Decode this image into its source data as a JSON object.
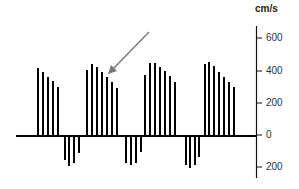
{
  "chart_data": {
    "type": "bar",
    "title": "",
    "xlabel": "",
    "ylabel": "cm/s",
    "ylim": [
      -250,
      650
    ],
    "grid": false,
    "axis_position": "right",
    "yticks": [
      600,
      400,
      200,
      0,
      -200
    ],
    "ytick_labels": [
      "600",
      "400",
      "200",
      "0",
      "200"
    ],
    "series": [
      {
        "name": "forward flow cycle 1",
        "x": [
          38,
          43,
          48,
          53,
          58
        ],
        "values": [
          425,
          400,
          369,
          344,
          306
        ]
      },
      {
        "name": "reverse flow 1",
        "x": [
          65,
          69,
          74,
          79
        ],
        "values": [
          -150,
          -188,
          -169,
          -106
        ]
      },
      {
        "name": "forward flow cycle 2",
        "x": [
          87,
          92,
          97,
          102,
          107,
          112,
          117
        ],
        "values": [
          413,
          450,
          431,
          400,
          369,
          338,
          300
        ]
      },
      {
        "name": "reverse flow 2",
        "x": [
          126,
          131,
          136,
          141
        ],
        "values": [
          -169,
          -181,
          -169,
          -100
        ]
      },
      {
        "name": "forward flow cycle 3",
        "x": [
          145,
          150,
          155,
          160,
          165,
          170,
          175
        ],
        "values": [
          381,
          456,
          456,
          431,
          406,
          375,
          338
        ]
      },
      {
        "name": "reverse flow 3",
        "x": [
          186,
          190,
          195,
          199
        ],
        "values": [
          -181,
          -200,
          -181,
          -131
        ]
      },
      {
        "name": "forward flow cycle 4",
        "x": [
          205,
          209,
          214,
          219,
          224,
          229,
          234
        ],
        "values": [
          450,
          463,
          438,
          400,
          369,
          338,
          306
        ]
      }
    ],
    "annotations": [
      {
        "type": "arrow",
        "from": [
          149,
          32
        ],
        "to": [
          109,
          73
        ],
        "color": "#777777",
        "points_to": "forward flow cycle 2"
      }
    ],
    "colors": {
      "bars": "#000000",
      "axis": "#111111",
      "arrow": "#777777"
    }
  },
  "axis": {
    "unit": "cm/s",
    "ticks": [
      {
        "label": "600",
        "y": 38
      },
      {
        "label": "400",
        "y": 71
      },
      {
        "label": "200",
        "y": 103
      },
      {
        "label": "0",
        "y": 135
      },
      {
        "label": "200",
        "y": 167
      }
    ]
  }
}
